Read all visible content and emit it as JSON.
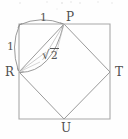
{
  "figure": {
    "type": "geometry-diagram",
    "canvas": {
      "width": 128,
      "height": 139
    },
    "colors": {
      "background": "#fefefe",
      "outer_square_stroke": "#a8a8a8",
      "inner_square_stroke": "#9a9a9a",
      "arc_stroke": "#8f8f8f",
      "label_text": "#4f4f4f"
    },
    "outer_square": {
      "name": "outer-square",
      "corners": [
        {
          "x": 19,
          "y": 24
        },
        {
          "x": 110,
          "y": 24
        },
        {
          "x": 110,
          "y": 119
        },
        {
          "x": 19,
          "y": 119
        }
      ]
    },
    "inner_square": {
      "name": "inner-rotated-square",
      "vertices": [
        {
          "label": "P",
          "x": 64,
          "y": 24
        },
        {
          "label": "T",
          "x": 110,
          "y": 72
        },
        {
          "label": "U",
          "x": 64,
          "y": 119
        },
        {
          "label": "R",
          "x": 19,
          "y": 72
        }
      ]
    },
    "vertex_labels": [
      {
        "name": "vertex-label-p",
        "text": "P",
        "x": 66,
        "y": 11
      },
      {
        "name": "vertex-label-r",
        "text": "R",
        "x": 5,
        "y": 66
      },
      {
        "name": "vertex-label-t",
        "text": "T",
        "x": 115,
        "y": 66
      },
      {
        "name": "vertex-label-u",
        "text": "U",
        "x": 61,
        "y": 122
      }
    ],
    "measure_arcs": [
      {
        "name": "arc-top-rp",
        "label": "1",
        "from": {
          "x": 19,
          "y": 24
        },
        "to": {
          "x": 64,
          "y": 24
        },
        "label_x": 40,
        "label_y": 12
      },
      {
        "name": "arc-left-r",
        "label": "1",
        "from": {
          "x": 19,
          "y": 24
        },
        "to": {
          "x": 19,
          "y": 72
        },
        "label_x": 7,
        "label_y": 41
      },
      {
        "name": "arc-diagonal-rp",
        "label": "√2",
        "from": {
          "x": 19,
          "y": 72
        },
        "to": {
          "x": 64,
          "y": 24
        },
        "label_x": 42,
        "label_y": 49
      }
    ],
    "measure_label_top": "1",
    "measure_label_left": "1",
    "measure_label_diagonal_radical": "√",
    "measure_label_diagonal_radicand": "2"
  }
}
